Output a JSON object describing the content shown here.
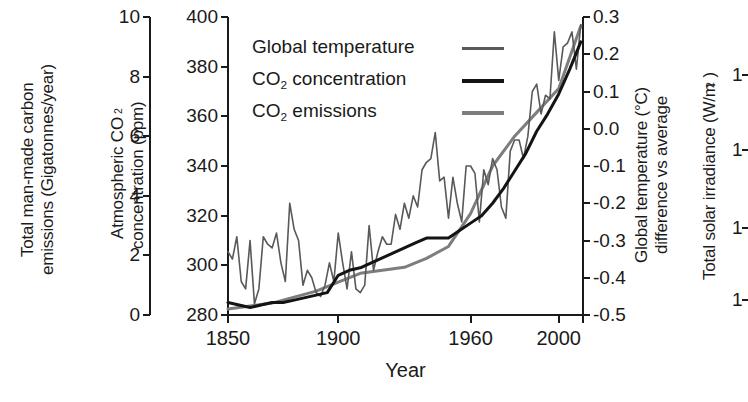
{
  "chart_data": {
    "type": "line",
    "title": "",
    "xlabel": "Year",
    "xlim": [
      1850,
      2011
    ],
    "xticks": [
      1850,
      1900,
      1960,
      2000
    ],
    "xtick_labels": [
      "1850",
      "1900",
      "1960",
      "2000"
    ],
    "grid": false,
    "legend_position": "top-center",
    "axes": [
      {
        "id": "emissions",
        "label": "Total man-made carbon emissions (Gigatonnes/year)",
        "label_line1": "Total man-made carbon",
        "label_line2": "emissions (Gigatonnes/year)",
        "side": "left",
        "position": 1,
        "ylim": [
          0,
          10
        ],
        "ticks": [
          0,
          2,
          4,
          6,
          8,
          10
        ],
        "tick_labels": [
          "0",
          "2",
          "4",
          "6",
          "8",
          "10"
        ]
      },
      {
        "id": "co2",
        "label": "Atmospheric CO2 concentration (ppm)",
        "label_line1_pre": "Atmospheric CO",
        "label_line1_sub": "2",
        "label_line2": "concentration (ppm)",
        "side": "left",
        "position": 2,
        "ylim": [
          280,
          400
        ],
        "ticks": [
          280,
          300,
          320,
          340,
          360,
          380,
          400
        ],
        "tick_labels": [
          "280",
          "300",
          "320",
          "340",
          "360",
          "380",
          "400"
        ]
      },
      {
        "id": "temperature",
        "label": "Global temperature (°C) difference vs average",
        "label_line1": "Global temperature (°C)",
        "label_line2": "difference vs average",
        "side": "right",
        "position": 1,
        "ylim": [
          -0.5,
          0.3
        ],
        "ticks": [
          -0.5,
          -0.4,
          -0.3,
          -0.2,
          -0.1,
          0.0,
          0.1,
          0.2,
          0.3
        ],
        "tick_labels": [
          "-0.5",
          "-0.4",
          "-0.3",
          "-0.2",
          "-0.1",
          "0.0",
          "0.1",
          "0.2",
          "0.3"
        ]
      },
      {
        "id": "irradiance",
        "label": "Total solar irradiance (W/m2)",
        "label_pre": "Total solar irradiance (W/m",
        "label_sup": "2",
        "label_post": ")",
        "side": "right",
        "position": 2,
        "tick_labels": [
          "1",
          "1",
          "1",
          "1"
        ]
      }
    ],
    "legend": [
      {
        "name": "Global temperature",
        "color": "#595959",
        "width": 1.6
      },
      {
        "name": "CO2 concentration",
        "label_pre": "CO",
        "label_sub": "2",
        "label_post": " concentration",
        "color": "#141414",
        "width": 3.0
      },
      {
        "name": "CO2 emissions",
        "label_pre": "CO",
        "label_sub": "2",
        "label_post": " emissions",
        "color": "#7d7d7d",
        "width": 3.0
      }
    ],
    "series": [
      {
        "name": "Global temperature",
        "axis": "temperature",
        "color": "#595959",
        "units": "°C difference vs average",
        "x": [
          1850,
          1852,
          1854,
          1856,
          1858,
          1860,
          1862,
          1864,
          1866,
          1868,
          1870,
          1872,
          1874,
          1876,
          1878,
          1880,
          1882,
          1884,
          1886,
          1888,
          1890,
          1892,
          1894,
          1896,
          1898,
          1900,
          1902,
          1904,
          1906,
          1908,
          1910,
          1912,
          1914,
          1916,
          1918,
          1920,
          1922,
          1924,
          1926,
          1928,
          1930,
          1932,
          1934,
          1936,
          1938,
          1940,
          1942,
          1944,
          1946,
          1948,
          1950,
          1952,
          1954,
          1956,
          1958,
          1960,
          1962,
          1964,
          1966,
          1968,
          1970,
          1972,
          1974,
          1976,
          1978,
          1980,
          1982,
          1984,
          1986,
          1988,
          1990,
          1992,
          1994,
          1996,
          1998,
          2000,
          2002,
          2004,
          2006,
          2008,
          2010
        ],
        "y": [
          -0.33,
          -0.35,
          -0.29,
          -0.41,
          -0.43,
          -0.3,
          -0.47,
          -0.43,
          -0.29,
          -0.31,
          -0.32,
          -0.28,
          -0.36,
          -0.41,
          -0.2,
          -0.27,
          -0.3,
          -0.42,
          -0.38,
          -0.4,
          -0.44,
          -0.45,
          -0.42,
          -0.36,
          -0.41,
          -0.28,
          -0.36,
          -0.43,
          -0.33,
          -0.43,
          -0.44,
          -0.42,
          -0.26,
          -0.38,
          -0.33,
          -0.29,
          -0.31,
          -0.31,
          -0.23,
          -0.27,
          -0.2,
          -0.24,
          -0.18,
          -0.21,
          -0.11,
          -0.09,
          -0.08,
          -0.01,
          -0.14,
          -0.13,
          -0.24,
          -0.13,
          -0.2,
          -0.25,
          -0.1,
          -0.1,
          -0.12,
          -0.25,
          -0.11,
          -0.15,
          -0.08,
          -0.11,
          -0.21,
          -0.24,
          -0.06,
          -0.03,
          -0.03,
          -0.08,
          -0.02,
          0.1,
          0.12,
          0.04,
          0.09,
          0.08,
          0.26,
          0.13,
          0.22,
          0.23,
          0.26,
          0.16,
          0.28
        ]
      },
      {
        "name": "CO2 concentration",
        "axis": "co2",
        "color": "#141414",
        "units": "ppm",
        "x": [
          1850,
          1855,
          1860,
          1865,
          1870,
          1875,
          1880,
          1885,
          1890,
          1895,
          1900,
          1905,
          1910,
          1915,
          1920,
          1925,
          1930,
          1935,
          1940,
          1945,
          1950,
          1955,
          1960,
          1965,
          1970,
          1975,
          1980,
          1985,
          1990,
          1995,
          2000,
          2005,
          2010
        ],
        "y": [
          285,
          284,
          283,
          284,
          285,
          285,
          286,
          287,
          288,
          289,
          296,
          298,
          299,
          301,
          303,
          305,
          307,
          309,
          311,
          311,
          311,
          314,
          317,
          320,
          325,
          331,
          338,
          345,
          354,
          361,
          369,
          379,
          390
        ]
      },
      {
        "name": "CO2 emissions",
        "axis": "emissions",
        "color": "#7d7d7d",
        "units": "Gigatonnes/year",
        "x": [
          1850,
          1860,
          1870,
          1880,
          1890,
          1900,
          1910,
          1920,
          1930,
          1940,
          1950,
          1960,
          1970,
          1980,
          1990,
          2000,
          2010
        ],
        "y": [
          0.2,
          0.3,
          0.4,
          0.6,
          0.8,
          1.1,
          1.4,
          1.5,
          1.6,
          1.9,
          2.3,
          3.4,
          5.0,
          6.0,
          6.8,
          7.6,
          9.7
        ]
      }
    ]
  },
  "plot_geometry": {
    "left_px": 228,
    "right_px": 583,
    "top_px": 17,
    "bottom_px": 315
  }
}
